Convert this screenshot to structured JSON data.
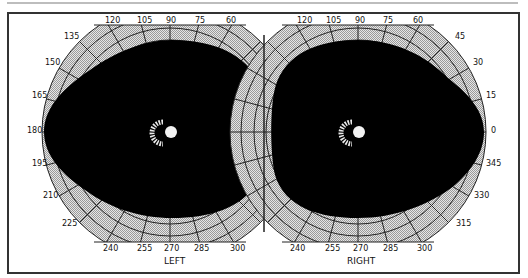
{
  "figure": {
    "type": "visual-field-perimetry-chart",
    "panels": [
      {
        "eye": "LEFT",
        "angle_labels": [
          "120",
          "105",
          "90",
          "75",
          "60",
          "135",
          "150",
          "165",
          "180",
          "195",
          "210",
          "225",
          "240",
          "255",
          "270",
          "285",
          "300"
        ]
      },
      {
        "eye": "RIGHT",
        "angle_labels": [
          "120",
          "105",
          "90",
          "75",
          "60",
          "45",
          "30",
          "15",
          "0",
          "345",
          "330",
          "315",
          "240",
          "255",
          "270",
          "285",
          "300"
        ]
      }
    ],
    "colors": {
      "field": "#000000",
      "grid_fill": "#cfcfcf",
      "grid_line": "#222222",
      "frame": "#333333",
      "blind_spot": "#f2f2f2"
    }
  },
  "labels": {
    "left_eye": "LEFT",
    "right_eye": "RIGHT",
    "l120": "120",
    "l105": "105",
    "l90": "90",
    "l75": "75",
    "l60": "60",
    "l135": "135",
    "l150": "150",
    "l165": "165",
    "l180": "180",
    "l195": "195",
    "l210": "210",
    "l225": "225",
    "l240": "240",
    "l255": "255",
    "l270": "270",
    "l285": "285",
    "l300": "300",
    "r120": "120",
    "r105": "105",
    "r90": "90",
    "r75": "75",
    "r60": "60",
    "r45": "45",
    "r30": "30",
    "r15": "15",
    "r0": "0",
    "r345": "345",
    "r330": "330",
    "r315": "315",
    "r240": "240",
    "r255": "255",
    "r270": "270",
    "r285": "285",
    "r300": "300"
  }
}
